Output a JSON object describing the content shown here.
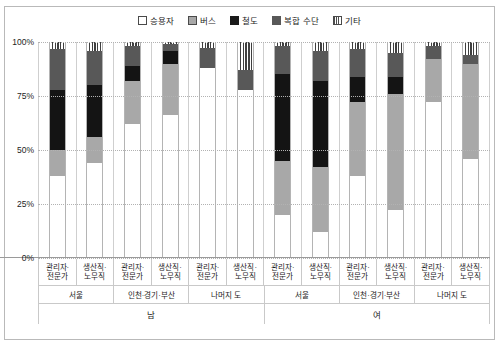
{
  "legend": {
    "position": "top-center",
    "items": [
      {
        "label": "승용자",
        "key": "car",
        "color": "#ffffff",
        "icon": "legend-swatch-car"
      },
      {
        "label": "버스",
        "key": "bus",
        "color": "#a8a8a8",
        "icon": "legend-swatch-bus"
      },
      {
        "label": "철도",
        "key": "rail",
        "color": "#141414",
        "icon": "legend-swatch-rail"
      },
      {
        "label": "복합 수단",
        "key": "multi",
        "color": "#585858",
        "icon": "legend-swatch-multi"
      },
      {
        "label": "기타",
        "key": "etc",
        "color": "#3f3f3f",
        "icon": "legend-swatch-etc"
      }
    ]
  },
  "yaxis": {
    "ticks": [
      "100%",
      "75%",
      "50%",
      "25%",
      "0%"
    ],
    "values": [
      100,
      75,
      50,
      25,
      0
    ]
  },
  "occupations": [
    "관리자·\n전문가",
    "생산직·\n노무직"
  ],
  "axis_rows": {
    "occupation": [
      {
        "line1": "관리자·",
        "line2": "전문가"
      },
      {
        "line1": "생산직·",
        "line2": "노무직"
      },
      {
        "line1": "관리자·",
        "line2": "전문가"
      },
      {
        "line1": "생산직·",
        "line2": "노무직"
      },
      {
        "line1": "관리자·",
        "line2": "전문가"
      },
      {
        "line1": "생산직·",
        "line2": "노무직"
      },
      {
        "line1": "관리자·",
        "line2": "전문가"
      },
      {
        "line1": "생산직·",
        "line2": "노무직"
      },
      {
        "line1": "관리자·",
        "line2": "전문가"
      },
      {
        "line1": "생산직·",
        "line2": "노무직"
      },
      {
        "line1": "관리자·",
        "line2": "전문가"
      },
      {
        "line1": "생산직·",
        "line2": "노무직"
      }
    ],
    "region": [
      {
        "label": "서울",
        "span": 2
      },
      {
        "label": "인천·경기·부산",
        "span": 2
      },
      {
        "label": "나머지 도",
        "span": 2
      },
      {
        "label": "서울",
        "span": 2
      },
      {
        "label": "인천·경기·부산",
        "span": 2
      },
      {
        "label": "나머지 도",
        "span": 2
      }
    ],
    "sex": [
      {
        "label": "남",
        "span": 6
      },
      {
        "label": "여",
        "span": 6
      }
    ]
  },
  "chart_data": {
    "type": "bar",
    "subtype": "stacked-100-percent",
    "title": "",
    "xlabel": "",
    "ylabel": "",
    "ylim": [
      0,
      100
    ],
    "grid": true,
    "legend_position": "top-center",
    "categories": [
      "남 / 서울 / 관리자·전문가",
      "남 / 서울 / 생산직·노무직",
      "남 / 인천·경기·부산 / 관리자·전문가",
      "남 / 인천·경기·부산 / 생산직·노무직",
      "남 / 나머지 도 / 관리자·전문가",
      "남 / 나머지 도 / 생산직·노무직",
      "여 / 서울 / 관리자·전문가",
      "여 / 서울 / 생산직·노무직",
      "여 / 인천·경기·부산 / 관리자·전문가",
      "여 / 인천·경기·부산 / 생산직·노무직",
      "여 / 나머지 도 / 관리자·전문가",
      "여 / 나머지 도 / 생산직·노무직"
    ],
    "series": [
      {
        "name": "승용자",
        "key": "car",
        "color": "#ffffff",
        "values": [
          38,
          44,
          62,
          66,
          88,
          78,
          20,
          12,
          38,
          22,
          72,
          46
        ]
      },
      {
        "name": "버스",
        "key": "bus",
        "color": "#a8a8a8",
        "values": [
          12,
          12,
          20,
          24,
          0,
          0,
          25,
          30,
          34,
          54,
          20,
          44
        ]
      },
      {
        "name": "철도",
        "key": "rail",
        "color": "#141414",
        "values": [
          28,
          24,
          7,
          6,
          0,
          0,
          40,
          40,
          12,
          8,
          0,
          0
        ]
      },
      {
        "name": "복합 수단",
        "key": "multi",
        "color": "#585858",
        "values": [
          19,
          16,
          9,
          3,
          9,
          9,
          13,
          14,
          13,
          11,
          6,
          4
        ]
      },
      {
        "name": "기타",
        "key": "etc",
        "color": "#3f3f3f",
        "values": [
          3,
          4,
          2,
          1,
          3,
          13,
          2,
          4,
          3,
          5,
          2,
          6
        ]
      }
    ]
  }
}
